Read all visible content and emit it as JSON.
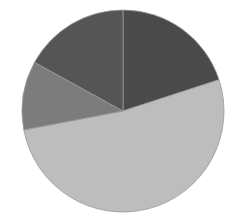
{
  "chart_data": {
    "type": "pie",
    "title": "",
    "categories": [
      "Slice 1",
      "Slice 2",
      "Slice 3",
      "Slice 4"
    ],
    "values": [
      20,
      52,
      11,
      17
    ],
    "colors": [
      "#4a4a4a",
      "#bdbdbd",
      "#7c7c7c",
      "#555555"
    ],
    "start_angle_deg": 0,
    "direction": "clockwise",
    "legend": "none",
    "labels_shown": false
  },
  "layout": {
    "cx": 123,
    "cy": 111,
    "r": 101,
    "separator_color": "#9a9a9a"
  }
}
